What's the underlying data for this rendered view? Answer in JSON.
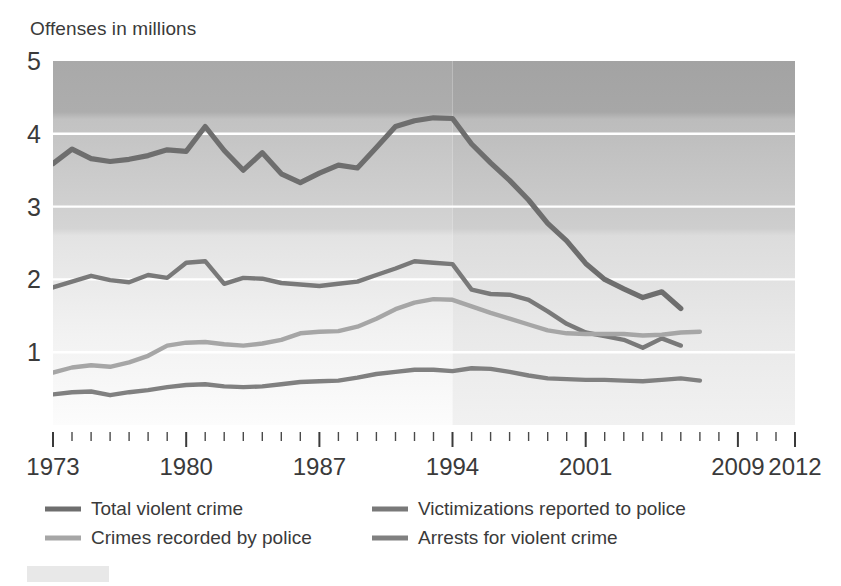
{
  "axis_title": "Offenses in millions",
  "chart_data": {
    "type": "line",
    "title": "",
    "subtitle": "",
    "xlabel": "",
    "ylabel": "Offenses in millions",
    "ylim": [
      0,
      5
    ],
    "xlim": [
      1973,
      2012
    ],
    "grid": true,
    "legend_position": "bottom",
    "y_ticks": [
      1,
      2,
      3,
      4,
      5
    ],
    "y_tick_labels": [
      "1",
      "2",
      "3",
      "4",
      "5"
    ],
    "x_ticks": [
      1973,
      1980,
      1987,
      1994,
      2001,
      2009,
      2012
    ],
    "x_tick_labels": [
      "1973",
      "1980",
      "1987",
      "1994",
      "2001",
      "2009",
      "2012"
    ],
    "x_minor_tick_step": 1,
    "annotations": [
      {
        "type": "shaded-region-boundary",
        "x": 1994,
        "note": "background shading changes at 1994"
      }
    ],
    "series": [
      {
        "name": "Total violent crime",
        "color": "#6e6e6e",
        "x": [
          1973,
          1974,
          1975,
          1976,
          1977,
          1978,
          1979,
          1980,
          1981,
          1982,
          1983,
          1984,
          1985,
          1986,
          1987,
          1988,
          1989,
          1990,
          1991,
          1992,
          1993,
          1994,
          1995,
          1996,
          1997,
          1998,
          1999,
          2000,
          2001,
          2002,
          2003,
          2004,
          2005,
          2006
        ],
        "values": [
          3.59,
          3.79,
          3.66,
          3.62,
          3.65,
          3.7,
          3.78,
          3.76,
          4.1,
          3.77,
          3.5,
          3.74,
          3.45,
          3.33,
          3.46,
          3.57,
          3.53,
          3.81,
          4.1,
          4.18,
          4.22,
          4.21,
          3.86,
          3.6,
          3.36,
          3.09,
          2.77,
          2.53,
          2.22,
          2.0,
          1.87,
          1.75,
          1.83,
          1.6
        ]
      },
      {
        "name": "Victimizations reported to police",
        "color": "#797979",
        "x": [
          1973,
          1974,
          1975,
          1976,
          1977,
          1978,
          1979,
          1980,
          1981,
          1982,
          1983,
          1984,
          1985,
          1986,
          1987,
          1988,
          1989,
          1990,
          1991,
          1992,
          1993,
          1994,
          1995,
          1996,
          1997,
          1998,
          1999,
          2000,
          2001,
          2002,
          2003,
          2004,
          2005,
          2006
        ],
        "values": [
          1.89,
          1.97,
          2.05,
          1.99,
          1.96,
          2.06,
          2.02,
          2.23,
          2.25,
          1.94,
          2.02,
          2.01,
          1.95,
          1.93,
          1.91,
          1.94,
          1.97,
          2.06,
          2.15,
          2.25,
          2.23,
          2.21,
          1.86,
          1.8,
          1.79,
          1.72,
          1.56,
          1.39,
          1.27,
          1.22,
          1.17,
          1.06,
          1.19,
          1.09
        ]
      },
      {
        "name": "Crimes recorded by police",
        "color": "#a6a6a6",
        "x": [
          1973,
          1974,
          1975,
          1976,
          1977,
          1978,
          1979,
          1980,
          1981,
          1982,
          1983,
          1984,
          1985,
          1986,
          1987,
          1988,
          1989,
          1990,
          1991,
          1992,
          1993,
          1994,
          1995,
          1996,
          1997,
          1998,
          1999,
          2000,
          2001,
          2002,
          2003,
          2004,
          2005,
          2006,
          2007
        ],
        "values": [
          0.72,
          0.79,
          0.82,
          0.8,
          0.86,
          0.95,
          1.09,
          1.13,
          1.14,
          1.11,
          1.09,
          1.12,
          1.17,
          1.26,
          1.28,
          1.29,
          1.35,
          1.46,
          1.59,
          1.68,
          1.73,
          1.72,
          1.63,
          1.54,
          1.46,
          1.38,
          1.3,
          1.26,
          1.25,
          1.25,
          1.25,
          1.23,
          1.24,
          1.27,
          1.28
        ]
      },
      {
        "name": "Arrests for violent crime",
        "color": "#808080",
        "x": [
          1973,
          1974,
          1975,
          1976,
          1977,
          1978,
          1979,
          1980,
          1981,
          1982,
          1983,
          1984,
          1985,
          1986,
          1987,
          1988,
          1989,
          1990,
          1991,
          1992,
          1993,
          1994,
          1995,
          1996,
          1997,
          1998,
          1999,
          2000,
          2001,
          2002,
          2003,
          2004,
          2005,
          2006,
          2007
        ],
        "values": [
          0.42,
          0.45,
          0.46,
          0.41,
          0.45,
          0.48,
          0.52,
          0.55,
          0.56,
          0.53,
          0.52,
          0.53,
          0.56,
          0.59,
          0.6,
          0.61,
          0.65,
          0.7,
          0.73,
          0.76,
          0.76,
          0.74,
          0.78,
          0.77,
          0.73,
          0.68,
          0.64,
          0.63,
          0.62,
          0.62,
          0.61,
          0.6,
          0.62,
          0.64,
          0.61
        ]
      }
    ]
  },
  "legend": {
    "items": [
      {
        "label": "Total violent crime",
        "color": "#6e6e6e"
      },
      {
        "label": "Victimizations reported to police",
        "color": "#797979"
      },
      {
        "label": "Crimes recorded by police",
        "color": "#a6a6a6"
      },
      {
        "label": "Arrests for violent crime",
        "color": "#808080"
      }
    ]
  },
  "colors": {
    "plot_bg_top": "#adadad",
    "plot_bg_bottom": "#fbfbfb",
    "gridline": "#ffffff",
    "text": "#3a3a3a",
    "footer_swatch": "#e8e8e8"
  }
}
